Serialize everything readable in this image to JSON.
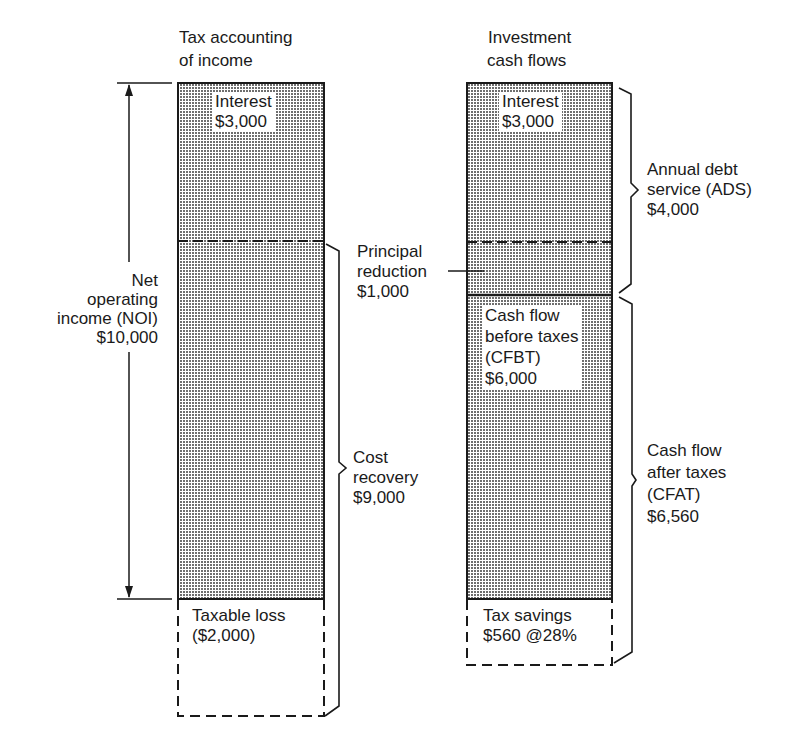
{
  "diagram": {
    "left_column": {
      "title_line1": "Tax accounting",
      "title_line2": "of income",
      "interest_label": "Interest",
      "interest_value": "$3,000",
      "taxable_loss_label": "Taxable loss",
      "taxable_loss_value": "($2,000)"
    },
    "right_column": {
      "title_line1": "Investment",
      "title_line2": "cash flows",
      "interest_label": "Interest",
      "interest_value": "$3,000",
      "cfbt_line1": "Cash flow",
      "cfbt_line2": "before taxes",
      "cfbt_line3": "(CFBT)",
      "cfbt_value": "$6,000",
      "tax_savings_label": "Tax savings",
      "tax_savings_value": "$560 @28%"
    },
    "annotations": {
      "noi_line1": "Net",
      "noi_line2": "operating",
      "noi_line3": "income (NOI)",
      "noi_value": "$10,000",
      "principal_line1": "Principal",
      "principal_line2": "reduction",
      "principal_value": "$1,000",
      "cost_recovery_line1": "Cost",
      "cost_recovery_line2": "recovery",
      "cost_recovery_value": "$9,000",
      "ads_line1": "Annual debt",
      "ads_line2": "service (ADS)",
      "ads_value": "$4,000",
      "cfat_line1": "Cash flow",
      "cfat_line2": "after taxes",
      "cfat_line3": "(CFAT)",
      "cfat_value": "$6,560"
    },
    "colors": {
      "ink": "#1a1a1a",
      "shade": "#b8b8b8"
    }
  }
}
